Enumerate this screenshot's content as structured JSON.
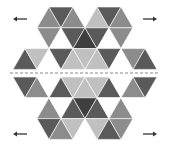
{
  "figure": {
    "shades": {
      "D": "#5a5a5a",
      "M": "#8c8c8c",
      "L": "#c0c0c0",
      "W": "#ffffff",
      "K": "#3f3f3f"
    },
    "top_half_rows": [
      [
        "M",
        "D",
        "M",
        "W",
        "L",
        "D",
        "M"
      ],
      [
        "W",
        "M",
        "W",
        "D",
        "K",
        "D",
        "W",
        "M",
        "W"
      ],
      [
        "D",
        "L",
        "W",
        "D",
        "L",
        "L",
        "L",
        "D",
        "W",
        "M",
        "D"
      ]
    ],
    "bottom_half_rows": [
      [
        "D",
        "M",
        "W",
        "D",
        "L",
        "L",
        "L",
        "D",
        "W",
        "M",
        "D"
      ],
      [
        "W",
        "M",
        "W",
        "D",
        "K",
        "D",
        "W",
        "M",
        "W"
      ],
      [
        "D",
        "M",
        "L",
        "W",
        "L",
        "D",
        "M"
      ]
    ],
    "arrows": [
      {
        "name": "arrow-top-left",
        "direction": "left",
        "glyph": "←"
      },
      {
        "name": "arrow-top-right",
        "direction": "right",
        "glyph": "→"
      },
      {
        "name": "arrow-bottom-left",
        "direction": "left",
        "glyph": "←"
      },
      {
        "name": "arrow-bottom-right",
        "direction": "right",
        "glyph": "→"
      }
    ],
    "cut_line": {
      "style": "dashed",
      "color": "#888888"
    }
  }
}
